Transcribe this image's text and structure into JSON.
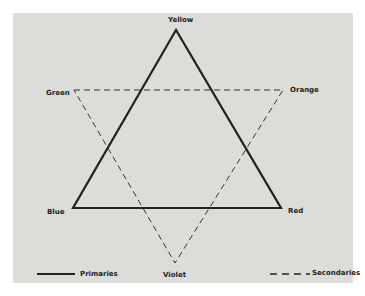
{
  "diagram": {
    "type": "color-star",
    "vertices": {
      "primaries": [
        {
          "name": "Yellow",
          "x": 176,
          "y": 30
        },
        {
          "name": "Blue",
          "x": 73,
          "y": 208
        },
        {
          "name": "Red",
          "x": 281,
          "y": 208
        }
      ],
      "secondaries": [
        {
          "name": "Green",
          "x": 74,
          "y": 90
        },
        {
          "name": "Orange",
          "x": 283,
          "y": 90
        },
        {
          "name": "Violet",
          "x": 175,
          "y": 263
        }
      ]
    },
    "labels": {
      "yellow": "Yellow",
      "green": "Green",
      "orange": "Orange",
      "blue": "Blue",
      "red": "Red",
      "violet": "Violet"
    },
    "legend": {
      "primaries": "Primaries",
      "secondaries": "Secondaries"
    },
    "colors": {
      "paper": "#dcdcd8",
      "ink": "#222222"
    }
  }
}
